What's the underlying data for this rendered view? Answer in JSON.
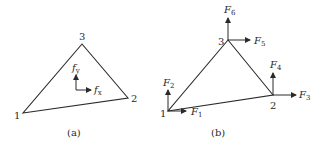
{
  "figure": {
    "panels": [
      {
        "id": "a",
        "caption": "(a)",
        "nodes": [
          {
            "label": "1",
            "x": 23,
            "y": 113
          },
          {
            "label": "2",
            "x": 128,
            "y": 98
          },
          {
            "label": "3",
            "x": 82,
            "y": 44
          }
        ],
        "body_forces": [
          {
            "symbol": "f",
            "subscript": "y",
            "direction": "up"
          },
          {
            "symbol": "f",
            "subscript": "x",
            "direction": "right"
          }
        ]
      },
      {
        "id": "b",
        "caption": "(b)",
        "nodes": [
          {
            "label": "1",
            "x": 168,
            "y": 111
          },
          {
            "label": "2",
            "x": 273,
            "y": 95
          },
          {
            "label": "3",
            "x": 228,
            "y": 40
          }
        ],
        "nodal_forces": [
          {
            "symbol": "F",
            "subscript": "1",
            "node": "1",
            "direction": "right"
          },
          {
            "symbol": "F",
            "subscript": "2",
            "node": "1",
            "direction": "up"
          },
          {
            "symbol": "F",
            "subscript": "3",
            "node": "2",
            "direction": "right"
          },
          {
            "symbol": "F",
            "subscript": "4",
            "node": "2",
            "direction": "up"
          },
          {
            "symbol": "F",
            "subscript": "5",
            "node": "3",
            "direction": "right"
          },
          {
            "symbol": "F",
            "subscript": "6",
            "node": "3",
            "direction": "up"
          }
        ]
      }
    ],
    "colors": {
      "line": "#2a2a2a",
      "background": "#ffffff"
    }
  }
}
